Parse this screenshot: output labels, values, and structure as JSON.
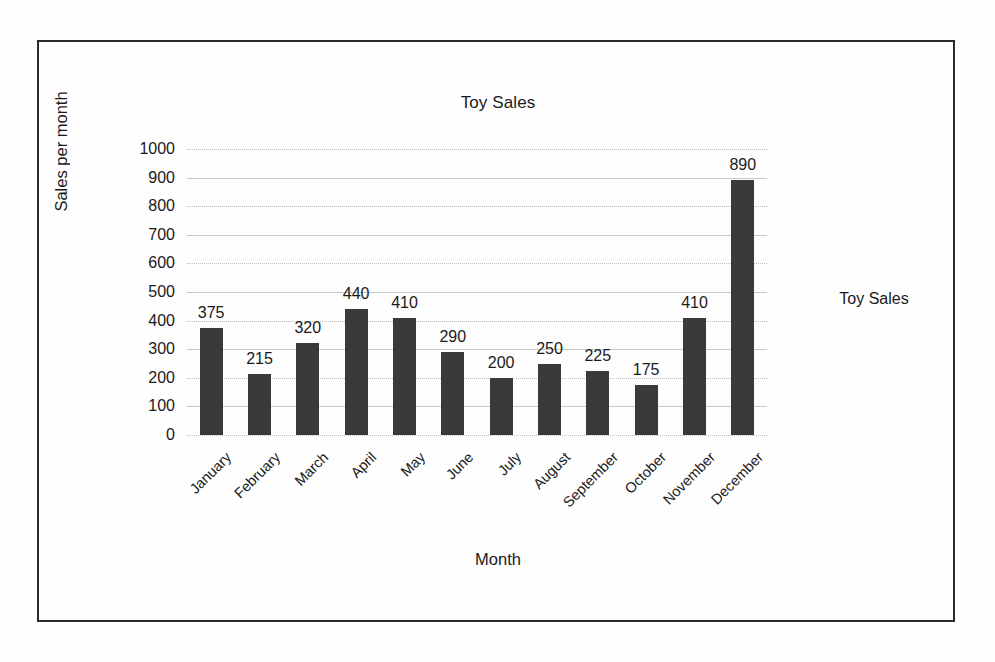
{
  "chart_data": {
    "type": "bar",
    "title": "Toy Sales",
    "xlabel": "Month",
    "ylabel": "Sales per month",
    "ylim": [
      0,
      1000
    ],
    "ytick_step": 100,
    "yticks": [
      "0",
      "100",
      "200",
      "300",
      "400",
      "500",
      "600",
      "700",
      "800",
      "900",
      "1000"
    ],
    "grid": true,
    "legend_position": "right",
    "legend": [
      "Toy Sales"
    ],
    "categories": [
      "January",
      "February",
      "March",
      "April",
      "May",
      "June",
      "July",
      "August",
      "September",
      "October",
      "November",
      "December"
    ],
    "values": [
      375,
      215,
      320,
      440,
      410,
      290,
      200,
      250,
      225,
      175,
      410,
      890
    ],
    "data_labels": [
      "375",
      "215",
      "320",
      "440",
      "410",
      "290",
      "200",
      "250",
      "225",
      "175",
      "410",
      "890"
    ],
    "series": [
      {
        "name": "Toy Sales",
        "values": [
          375,
          215,
          320,
          440,
          410,
          290,
          200,
          250,
          225,
          175,
          410,
          890
        ],
        "color": "#3a3a3a"
      }
    ]
  },
  "colors": {
    "bar": "#3a3a3a",
    "gridline": "#c9c9c9",
    "frame": "#2b2b2f",
    "text": "#1a1a1a",
    "background": "#fefefe"
  }
}
